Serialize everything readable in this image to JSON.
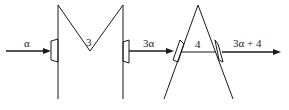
{
  "diagram": {
    "input_label": "α",
    "element_left": {
      "label": "3",
      "shape": "M-shaped element"
    },
    "middle_label": "3α",
    "element_right": {
      "label": "4",
      "shape": "A-shaped element"
    },
    "output_label": "3α + 4"
  }
}
